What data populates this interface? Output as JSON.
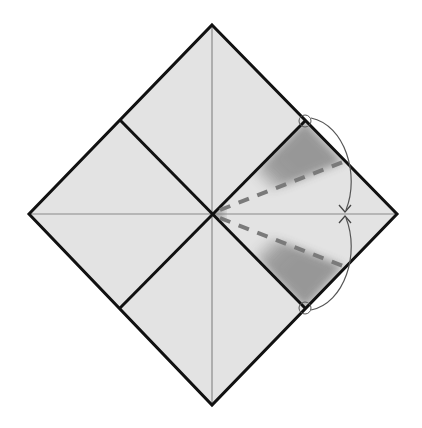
{
  "diagram": {
    "type": "origami-fold-diagram",
    "colors": {
      "background": "#ffffff",
      "paper": "#e3e3e3",
      "outline": "#111111",
      "crease": "#777777",
      "valley_fold": "#7a7a7a",
      "shade": "#8a8a8a",
      "arrow": "#555555"
    },
    "geometry": {
      "top": [
        212,
        25
      ],
      "left": [
        29,
        214
      ],
      "right": [
        397,
        214
      ],
      "bottom": [
        212,
        405
      ],
      "center": [
        213,
        214
      ],
      "mid_top_left": [
        120,
        120
      ],
      "mid_top_right": [
        305,
        121
      ],
      "mid_bottom_left": [
        120,
        308
      ],
      "mid_bottom_right": [
        305,
        308
      ],
      "valley_upper_end": [
        343,
        162
      ],
      "valley_lower_end": [
        343,
        266
      ],
      "arrow_target": [
        344,
        214
      ]
    },
    "elements": [
      {
        "name": "outer-square",
        "kind": "thick-outline"
      },
      {
        "name": "inner-square",
        "kind": "thick-outline"
      },
      {
        "name": "horizontal-crease",
        "kind": "thin-crease"
      },
      {
        "name": "vertical-crease",
        "kind": "thin-crease"
      },
      {
        "name": "valley-fold-upper",
        "kind": "dashed"
      },
      {
        "name": "valley-fold-lower",
        "kind": "dashed"
      },
      {
        "name": "fold-arrow-upper",
        "kind": "curved-arrow"
      },
      {
        "name": "fold-arrow-lower",
        "kind": "curved-arrow"
      },
      {
        "name": "reference-circle-top",
        "kind": "circle-marker"
      },
      {
        "name": "reference-circle-bottom",
        "kind": "circle-marker"
      }
    ]
  }
}
